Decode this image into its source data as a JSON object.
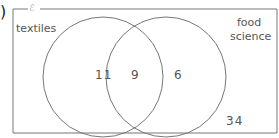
{
  "question_marker": ")",
  "universal_set_symbol": "ℰ",
  "sets": {
    "left": {
      "label": "textiles"
    },
    "right": {
      "label_line1": "food",
      "label_line2": "science"
    }
  },
  "regions": {
    "left_only": "11",
    "both": "9",
    "right_only": "6",
    "neither": "34"
  },
  "colors": {
    "line": "#777777",
    "text": "#555555"
  }
}
